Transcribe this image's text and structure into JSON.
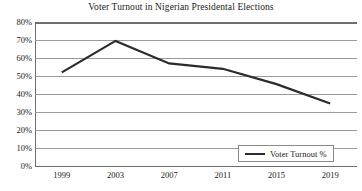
{
  "chart_data": {
    "type": "line",
    "title": "Voter Turnout in Nigerian Presidental Elections",
    "xlabel": "",
    "ylabel": "",
    "categories": [
      "1999",
      "2003",
      "2007",
      "2011",
      "2015",
      "2019"
    ],
    "x": [
      1999,
      2003,
      2007,
      2011,
      2015,
      2019
    ],
    "series": [
      {
        "name": "Voter Turnout %",
        "values": [
          52,
          69.5,
          57,
          54,
          45.5,
          34.7
        ],
        "color": "#2b2b2b"
      }
    ],
    "ylim": [
      0,
      80
    ],
    "ytick_values": [
      80,
      70,
      60,
      50,
      40,
      30,
      20,
      10,
      0
    ],
    "ytick_labels": [
      "80%",
      "70%",
      "60%",
      "50%",
      "40%",
      "30%",
      "20%",
      "10%",
      "0%"
    ],
    "grid": true,
    "grid_axis": "y",
    "legend_position": "bottom-right",
    "legend_entries": [
      "Voter Turnout %"
    ]
  },
  "legend": {
    "label": "Voter Turnout %"
  }
}
